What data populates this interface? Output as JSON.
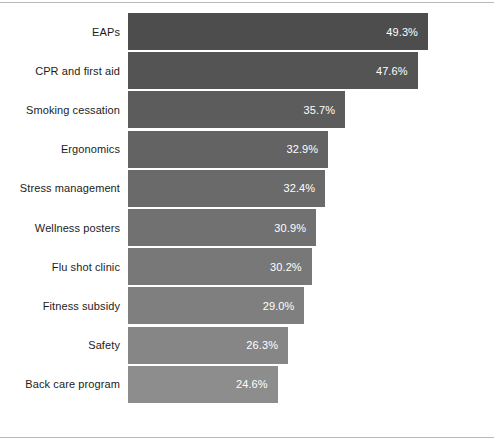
{
  "chart_data": {
    "type": "bar",
    "orientation": "horizontal",
    "title": "",
    "subtitle": "",
    "xlabel": "",
    "ylabel": "",
    "xlim": [
      0,
      49.3
    ],
    "grid": false,
    "legend": null,
    "value_format": "percent_one_decimal",
    "categories": [
      "EAPs",
      "CPR and first aid",
      "Smoking cessation",
      "Ergonomics",
      "Stress management",
      "Wellness posters",
      "Flu shot clinic",
      "Fitness subsidy",
      "Safety",
      "Back care program"
    ],
    "values": [
      49.3,
      47.6,
      35.7,
      32.9,
      32.4,
      30.9,
      30.2,
      29.0,
      26.3,
      24.6
    ],
    "value_labels": [
      "49.3%",
      "47.6%",
      "35.7%",
      "32.9%",
      "32.4%",
      "30.9%",
      "30.2%",
      "29.0%",
      "26.3%",
      "24.6%"
    ],
    "bar_colors": [
      "#4d4d4d",
      "#545454",
      "#5c5c5c",
      "#636363",
      "#6a6a6a",
      "#717171",
      "#787878",
      "#7f7f7f",
      "#868686",
      "#8d8d8d"
    ],
    "label_color": "#1c1c1c",
    "value_text_color": "#ffffff",
    "background_color": "#ffffff",
    "frame_rule_color": "#b9b9b9"
  }
}
